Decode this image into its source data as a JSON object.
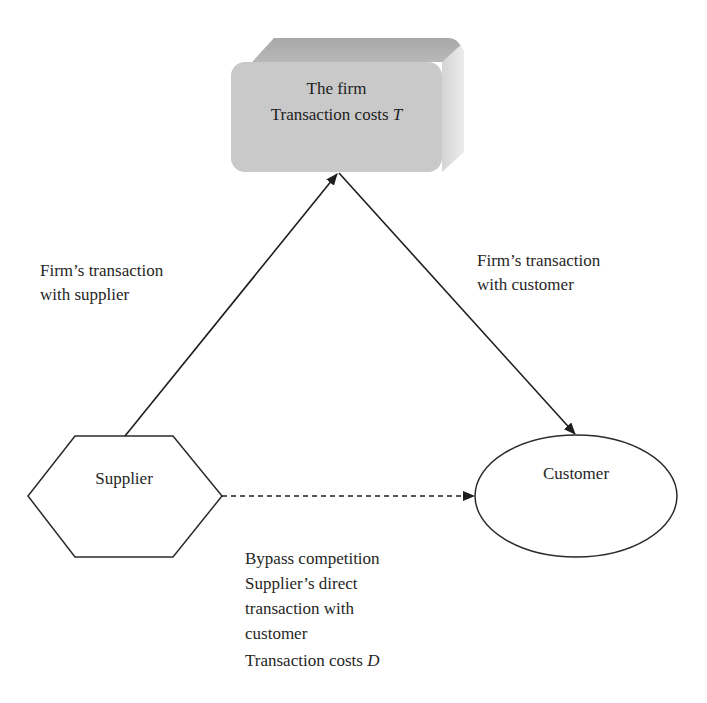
{
  "nodes": {
    "firm": {
      "title": "The firm",
      "cost_prefix": "Transaction costs ",
      "cost_symbol": "T",
      "shape": "3d-rounded-box",
      "fill": "#c9c9c9"
    },
    "supplier": {
      "label": "Supplier",
      "shape": "hexagon"
    },
    "customer": {
      "label": "Customer",
      "shape": "ellipse"
    }
  },
  "edges": {
    "supplier_to_firm": {
      "label_lines": [
        "Firm’s transaction",
        "with supplier"
      ],
      "style": "solid"
    },
    "firm_to_customer": {
      "label_lines": [
        "Firm’s transaction",
        "with customer"
      ],
      "style": "solid"
    },
    "supplier_to_customer": {
      "label_lines": [
        "Bypass competition",
        "Supplier’s direct",
        "transaction with",
        "customer"
      ],
      "cost_prefix": "Transaction costs ",
      "cost_symbol": "D",
      "style": "dashed"
    }
  },
  "colors": {
    "stroke": "#2a2a2a",
    "text": "#262626",
    "firm_front": "#c9c9c9",
    "firm_top": "#b0b0b0",
    "firm_side": "#e0e0e0"
  }
}
